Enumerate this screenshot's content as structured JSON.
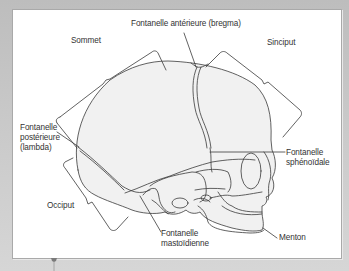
{
  "figure": {
    "labels": {
      "fontanelle_anterieure": "Fontanelle antérieure (bregma)",
      "sommet": "Sommet",
      "sinciput": "Sinciput",
      "fontanelle_posterieure": [
        "Fontanelle",
        "postérieure",
        "(lambda)"
      ],
      "fontanelle_sphenoidale": [
        "Fontanelle",
        "sphénoïdale"
      ],
      "occiput": "Occiput",
      "fontanelle_mastoidienne": [
        "Fontanelle",
        "mastoïdienne"
      ],
      "menton": "Menton"
    },
    "colors": {
      "background": "#c4c4c4",
      "panel": "#ffffff",
      "skull_fill": "#f1f1f1",
      "line": "#3a3a3a"
    }
  }
}
